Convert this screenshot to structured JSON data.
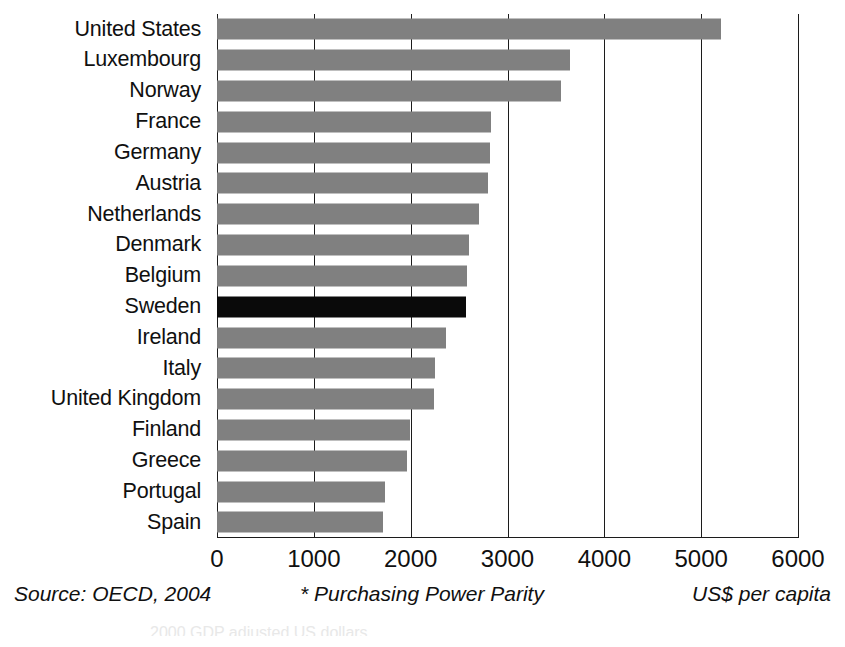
{
  "chart_data": {
    "type": "bar",
    "orientation": "horizontal",
    "title": "",
    "subtitle": "",
    "xlabel": "",
    "ylabel": "",
    "xlim": [
      0,
      6000
    ],
    "xticks": [
      0,
      1000,
      2000,
      3000,
      4000,
      5000,
      6000
    ],
    "xticklabels": [
      "0",
      "1000",
      "2000",
      "3000",
      "4000",
      "5000",
      "6000"
    ],
    "grid": "vertical",
    "legend": "none",
    "categories": [
      "United States",
      "Luxembourg",
      "Norway",
      "France",
      "Germany",
      "Austria",
      "Netherlands",
      "Denmark",
      "Belgium",
      "Sweden",
      "Ireland",
      "Italy",
      "United Kingdom",
      "Finland",
      "Greece",
      "Portugal",
      "Spain"
    ],
    "values": [
      5200,
      3650,
      3550,
      2830,
      2820,
      2800,
      2710,
      2600,
      2580,
      2570,
      2370,
      2250,
      2240,
      1990,
      1960,
      1740,
      1710
    ],
    "highlighted_category": "Sweden",
    "colors": {
      "bar": "#808080",
      "highlight": "#0a0a0a",
      "axis": "#1c1c1c",
      "text": "#101010",
      "background": "#ffffff"
    }
  },
  "footer": {
    "source": "Source: OECD, 2004",
    "note": "* Purchasing Power Parity",
    "unit": "US$ per capita",
    "cut_caption": "2000 GDP adjusted US dollars"
  }
}
